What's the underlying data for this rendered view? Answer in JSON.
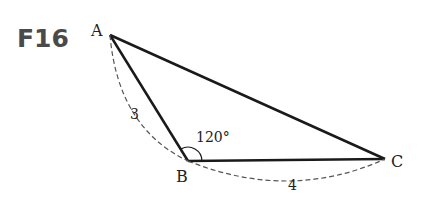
{
  "problem": {
    "title": "F16"
  },
  "triangle": {
    "vertices": {
      "A": {
        "label": "A",
        "x": 110,
        "y": 35
      },
      "B": {
        "label": "B",
        "x": 188,
        "y": 161
      },
      "C": {
        "label": "C",
        "x": 385,
        "y": 159
      }
    },
    "sides": {
      "AB": {
        "length_label": "3"
      },
      "BC": {
        "length_label": "4"
      }
    },
    "angle_B": {
      "label": "120°"
    }
  }
}
